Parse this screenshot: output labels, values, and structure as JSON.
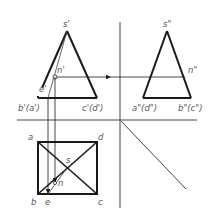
{
  "figure": {
    "colors": {
      "line": "#1a1a1a",
      "thin": "#444444",
      "label": "#555555",
      "background": "#ffffff"
    }
  },
  "front_view": {
    "apex": "s'",
    "point_n": "n'",
    "point_e": "e'",
    "base_left": "b'(a')",
    "base_right": "c'(d')"
  },
  "side_view": {
    "apex": "s\"",
    "point_n": "n\"",
    "base_left": "a\"(d\")",
    "base_right": "b\"(c\")"
  },
  "top_view": {
    "corner_a": "a",
    "corner_d": "d",
    "center_s": "s",
    "point_n": "n",
    "corner_b": "b",
    "point_e": "e",
    "corner_c": "c"
  }
}
